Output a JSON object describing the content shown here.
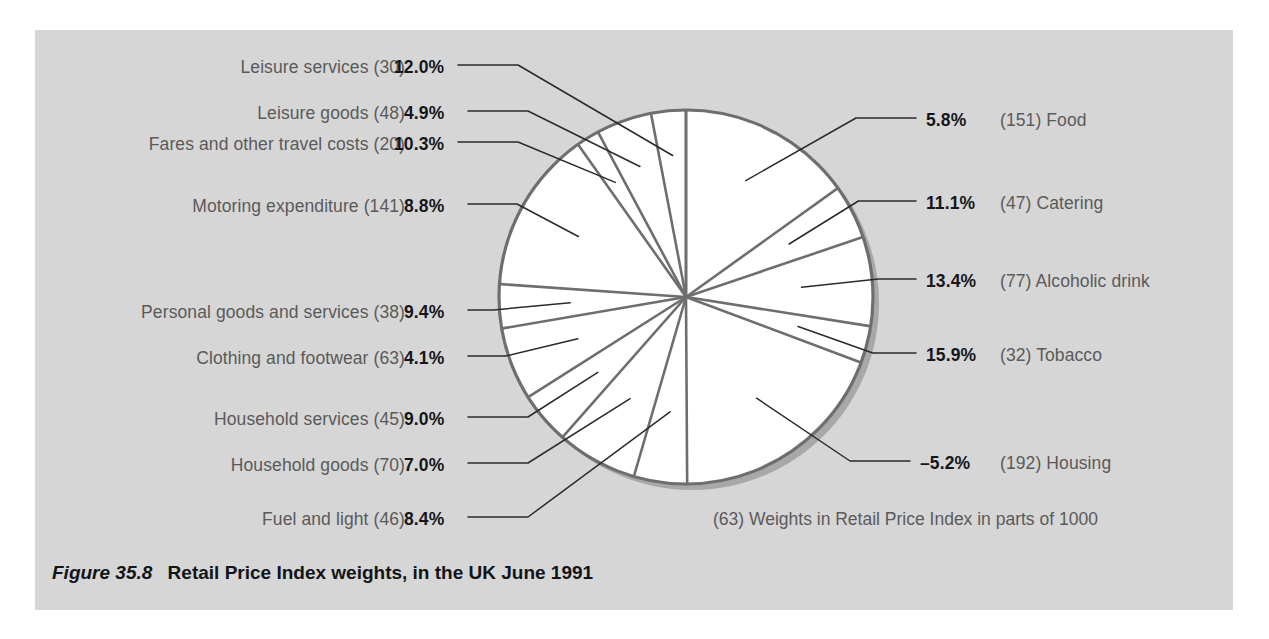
{
  "figure": {
    "number": "Figure 35.8",
    "title": "Retail Price Index weights, in the UK June 1991",
    "footnote": "(63) Weights in Retail Price Index in parts of 1000"
  },
  "colors": {
    "panel_background": "#d6d6d6",
    "page_background": "#ffffff",
    "pie_fill": "#ffffff",
    "pie_outline": "#6e6e6e",
    "pie_shadow": "#a8a8a8",
    "label_text": "#5a5a5a",
    "percent_text": "#15161a",
    "leader_line": "#2a2a2a"
  },
  "chart_data": {
    "type": "pie",
    "title": "Retail Price Index weights, in the UK June 1991",
    "value_label": "Weights in Retail Price Index in parts of 1000",
    "total_weight": 1000,
    "units": "parts of 1000",
    "legend": "inline-leader-labels",
    "categories": [
      "Food",
      "Catering",
      "Alcoholic drink",
      "Tobacco",
      "Housing",
      "Fuel and light",
      "Household goods",
      "Household services",
      "Clothing and footwear",
      "Personal goods and services",
      "Motoring expenditure",
      "Fares and other travel costs",
      "Leisure goods",
      "Leisure services"
    ],
    "values": [
      151,
      47,
      77,
      32,
      192,
      46,
      70,
      45,
      63,
      38,
      141,
      20,
      48,
      30
    ],
    "series": [
      {
        "name": "Weight (parts of 1000)",
        "values": [
          151,
          47,
          77,
          32,
          192,
          46,
          70,
          45,
          63,
          38,
          141,
          20,
          48,
          30
        ]
      },
      {
        "name": "Annual percentage change",
        "values": [
          5.8,
          11.1,
          13.4,
          15.9,
          -5.2,
          8.4,
          7.0,
          9.0,
          4.1,
          9.4,
          8.8,
          10.3,
          4.9,
          12.0
        ]
      }
    ],
    "slices": [
      {
        "name": "Food",
        "weight": 151,
        "percent": "5.8%",
        "weight_label": "(151)",
        "side": "right"
      },
      {
        "name": "Catering",
        "weight": 47,
        "percent": "11.1%",
        "weight_label": "(47)",
        "side": "right"
      },
      {
        "name": "Alcoholic drink",
        "weight": 77,
        "percent": "13.4%",
        "weight_label": "(77)",
        "side": "right"
      },
      {
        "name": "Tobacco",
        "weight": 32,
        "percent": "15.9%",
        "weight_label": "(32)",
        "side": "right"
      },
      {
        "name": "Housing",
        "weight": 192,
        "percent": "–5.2%",
        "weight_label": "(192)",
        "side": "right"
      },
      {
        "name": "Fuel and light",
        "weight": 46,
        "percent": "8.4%",
        "weight_label": "(46)",
        "side": "left"
      },
      {
        "name": "Household goods",
        "weight": 70,
        "percent": "7.0%",
        "weight_label": "(70)",
        "side": "left"
      },
      {
        "name": "Household services",
        "weight": 45,
        "percent": "9.0%",
        "weight_label": "(45)",
        "side": "left"
      },
      {
        "name": "Clothing and footwear",
        "weight": 63,
        "percent": "4.1%",
        "weight_label": "(63)",
        "side": "left"
      },
      {
        "name": "Personal goods and services",
        "weight": 38,
        "percent": "9.4%",
        "weight_label": "(38)",
        "side": "left"
      },
      {
        "name": "Motoring expenditure",
        "weight": 141,
        "percent": "8.8%",
        "weight_label": "(141)",
        "side": "left"
      },
      {
        "name": "Fares and other travel costs",
        "weight": 20,
        "percent": "10.3%",
        "weight_label": "(20)",
        "side": "left"
      },
      {
        "name": "Leisure goods",
        "weight": 48,
        "percent": "4.9%",
        "weight_label": "(48)",
        "side": "left"
      },
      {
        "name": "Leisure services",
        "weight": 30,
        "percent": "12.0%",
        "weight_label": "(30)",
        "side": "left"
      }
    ]
  },
  "labels_left": [
    {
      "name": "Leisure services (30)",
      "percent": "12.0%"
    },
    {
      "name": "Leisure goods (48)",
      "percent": "4.9%"
    },
    {
      "name": "Fares and other travel costs (20)",
      "percent": "10.3%"
    },
    {
      "name": "Motoring expenditure (141)",
      "percent": "8.8%"
    },
    {
      "name": "Personal goods and services (38)",
      "percent": "9.4%"
    },
    {
      "name": "Clothing and footwear (63)",
      "percent": "4.1%"
    },
    {
      "name": "Household services (45)",
      "percent": "9.0%"
    },
    {
      "name": "Household goods (70)",
      "percent": "7.0%"
    },
    {
      "name": "Fuel and light (46)",
      "percent": "8.4%"
    }
  ],
  "labels_right": [
    {
      "percent": "5.8%",
      "name": "(151) Food"
    },
    {
      "percent": "11.1%",
      "name": "(47) Catering"
    },
    {
      "percent": "13.4%",
      "name": "(77) Alcoholic drink"
    },
    {
      "percent": "15.9%",
      "name": "(32) Tobacco"
    },
    {
      "percent": "–5.2%",
      "name": "(192) Housing"
    }
  ]
}
